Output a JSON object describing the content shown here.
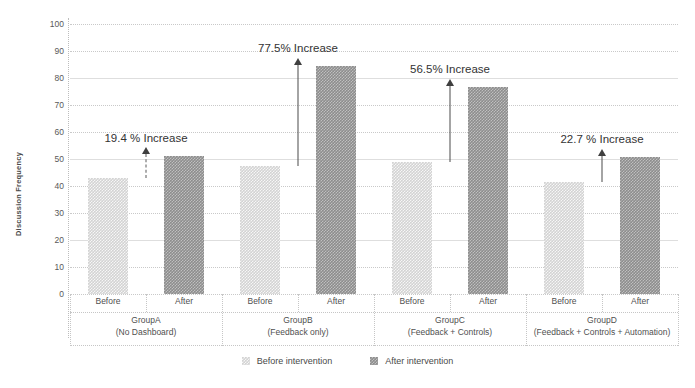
{
  "chart_data": {
    "type": "bar",
    "title": "",
    "xlabel": "",
    "ylabel": "Discussion Frequency",
    "ylim": [
      0,
      100
    ],
    "yticks": [
      0,
      10,
      20,
      30,
      40,
      50,
      60,
      70,
      80,
      90,
      100
    ],
    "grid": true,
    "legend_position": "bottom",
    "categories": [
      "GroupA",
      "GroupB",
      "GroupC",
      "GroupD"
    ],
    "category_sublabels": [
      "(No Dashboard)",
      "(Feedback only)",
      "(Feedback + Controls)",
      "(Feedback + Controls + Automation)"
    ],
    "subcategories": [
      "Before",
      "After"
    ],
    "series": [
      {
        "name": "Before intervention",
        "values": [
          43,
          47.5,
          49,
          41.5
        ],
        "color": "#d3d3d3"
      },
      {
        "name": "After intervention",
        "values": [
          51.3,
          84.3,
          76.7,
          50.9
        ],
        "color": "#8d8d8d"
      }
    ],
    "annotations": [
      {
        "group": "GroupA",
        "text": "19.4 % Increase",
        "value": 19.4,
        "arrow": "dashed"
      },
      {
        "group": "GroupB",
        "text": "77.5% Increase",
        "value": 77.5,
        "arrow": "solid"
      },
      {
        "group": "GroupC",
        "text": "56.5% Increase",
        "value": 56.5,
        "arrow": "solid"
      },
      {
        "group": "GroupD",
        "text": "22.7 % Increase",
        "value": 22.7,
        "arrow": "solid"
      }
    ]
  },
  "axis": {
    "y_title": "Discussion Frequency",
    "ticks": {
      "t0": "0",
      "t1": "10",
      "t2": "20",
      "t3": "30",
      "t4": "40",
      "t5": "50",
      "t6": "60",
      "t7": "70",
      "t8": "80",
      "t9": "90",
      "t10": "100"
    }
  },
  "groups": [
    {
      "name": "GroupA",
      "sub": "(No Dashboard)",
      "before_label": "Before",
      "after_label": "After",
      "annotation": "19.4 % Increase"
    },
    {
      "name": "GroupB",
      "sub": "(Feedback only)",
      "before_label": "Before",
      "after_label": "After",
      "annotation": "77.5% Increase"
    },
    {
      "name": "GroupC",
      "sub": "(Feedback + Controls)",
      "before_label": "Before",
      "after_label": "After",
      "annotation": "56.5% Increase"
    },
    {
      "name": "GroupD",
      "sub": "(Feedback + Controls + Automation)",
      "before_label": "Before",
      "after_label": "After",
      "annotation": "22.7 % Increase"
    }
  ],
  "legend": {
    "items": [
      {
        "label": "Before intervention",
        "icon": "square-pattern-light-swatch",
        "color": "#c9c9c9"
      },
      {
        "label": "After intervention",
        "icon": "square-pattern-dark-swatch",
        "color": "#8d8d8d"
      }
    ]
  }
}
